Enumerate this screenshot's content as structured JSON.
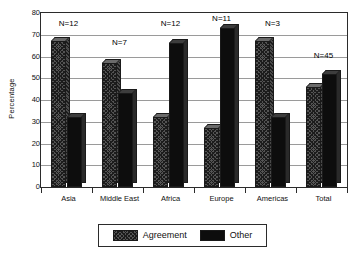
{
  "chart_data": {
    "type": "bar",
    "title": "",
    "xlabel": "",
    "ylabel": "Percentage",
    "ylim": [
      0,
      80
    ],
    "yticks": [
      0,
      10,
      20,
      30,
      40,
      50,
      60,
      70,
      80
    ],
    "ytick_labels": [
      "0",
      "10",
      "20",
      "30",
      "40",
      "50",
      "60",
      "70",
      "80"
    ],
    "grid": true,
    "legend_position": "bottom",
    "categories": [
      "Asia",
      "Middle East",
      "Africa",
      "Europe",
      "Americas",
      "Total"
    ],
    "series": [
      {
        "name": "Agreement",
        "color": "#545454",
        "pattern": "cross-hatch",
        "values": [
          67,
          57,
          32,
          27,
          67,
          46
        ]
      },
      {
        "name": "Other",
        "color": "#0d0d0d",
        "pattern": "solid",
        "values": [
          32,
          43,
          66,
          73,
          32,
          52
        ]
      }
    ],
    "annotations": [
      {
        "category": "Asia",
        "text": "N=12"
      },
      {
        "category": "Middle East",
        "text": "N=7"
      },
      {
        "category": "Africa",
        "text": "N=12"
      },
      {
        "category": "Europe",
        "text": "N=11"
      },
      {
        "category": "Americas",
        "text": "N=3"
      },
      {
        "category": "Total",
        "text": "N=45"
      }
    ],
    "annotation_y": [
      77,
      68,
      77,
      79,
      77,
      62
    ]
  },
  "legend": {
    "entries": [
      {
        "label": "Agreement"
      },
      {
        "label": "Other"
      }
    ]
  }
}
